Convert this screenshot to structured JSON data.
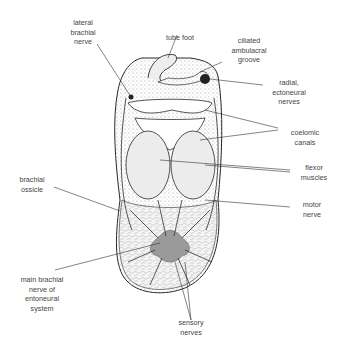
{
  "diagram": {
    "title": "",
    "labels": {
      "lateral_brachial_nerve": "lateral\nbrachial\nnerve",
      "tube_foot": "tube foot",
      "ciliated_ambulacral_groove": "ciliated\nambulacral\ngroove",
      "radial_ectoneural_nerves": "radial,\nectoneural\nnerves",
      "coelomic_canals": "coelomic\ncanals",
      "flexor_muscles": "flexor\nmuscles",
      "brachial_ossicle": "brachial\nossicle",
      "motor_nerve": "motor\nnerve",
      "main_brachial_nerve": "main brachial\nnerve of\nentoneural\nsystem",
      "sensory_nerves": "sensory\nnerves"
    },
    "colors": {
      "line": "#2a2a2a",
      "nerve_fill": "#9a9a9a",
      "stipple": "#d8d8d8",
      "background": "#ffffff"
    }
  }
}
